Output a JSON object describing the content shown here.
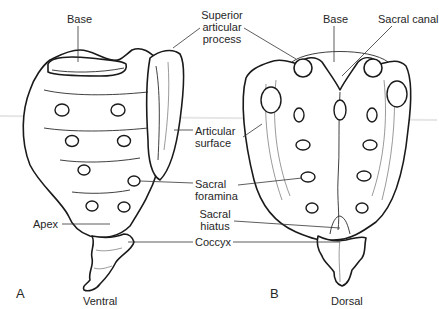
{
  "figure": {
    "panels": [
      {
        "letter": "A",
        "view": "Ventral"
      },
      {
        "letter": "B",
        "view": "Dorsal"
      }
    ],
    "labels": {
      "base_left": "Base",
      "superior_articular_process": [
        "Superior",
        "articular",
        "process"
      ],
      "base_right": "Base",
      "sacral_canal": "Sacral canal",
      "articular_surface": [
        "Articular",
        "surface"
      ],
      "sacral_foramina": [
        "Sacral",
        "foramina"
      ],
      "apex": "Apex",
      "sacral_hiatus": [
        "Sacral",
        "hiatus"
      ],
      "coccyx": "Coccyx"
    },
    "colors": {
      "line": "#1a1a1a",
      "text": "#262626",
      "background": "#ffffff"
    }
  }
}
